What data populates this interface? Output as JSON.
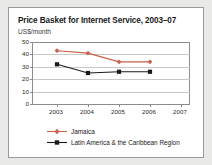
{
  "chart_data": {
    "type": "line",
    "title": "Price Basket for Internet Service, 2003–07",
    "subtitle": "US$/month",
    "xlabel": "",
    "ylabel": "US$/month",
    "categories": [
      "2003",
      "2004",
      "2005",
      "2006",
      "2007"
    ],
    "x_tick_labels": [
      "2003",
      "2004",
      "2005",
      "2006",
      "2007"
    ],
    "y_tick_labels": [
      "0",
      "10",
      "20",
      "30",
      "40",
      "50"
    ],
    "y_ticks": [
      0,
      10,
      20,
      30,
      40,
      50
    ],
    "ylim": [
      0,
      50
    ],
    "grid": "horizontal",
    "legend_position": "bottom-left",
    "series": [
      {
        "name": "Jamaica",
        "color": "#C9604A",
        "marker": "diamond",
        "values": [
          43,
          41,
          34,
          34,
          null
        ]
      },
      {
        "name": "Latin America & the Caribbean Region",
        "color": "#1a1a1a",
        "marker": "square",
        "values": [
          32,
          25,
          26,
          26,
          null
        ]
      }
    ]
  },
  "figure": {
    "panel_background": "#ffffff",
    "outer_background": "#e9e9e7",
    "border_color": "#9a9a9a"
  }
}
